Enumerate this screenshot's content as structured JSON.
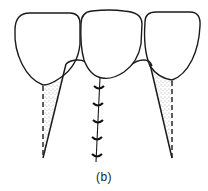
{
  "figure": {
    "caption": "(b)",
    "colors": {
      "line": "#1a1a1a",
      "stipple": "#555555",
      "background": "#ffffff"
    },
    "elements": {
      "teeth_count": 3,
      "suture_stitches": 5,
      "dashed_root_lines": 2
    }
  }
}
